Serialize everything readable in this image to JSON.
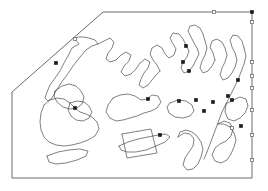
{
  "figure": {
    "kind": "vector-outline-map",
    "width": 268,
    "height": 191,
    "background_color": "#ffffff",
    "outline_color": "#4a4a4a",
    "frame_color": "#6b6b6b",
    "vertex_filled_color": "#1a1a1a",
    "vertex_open_fill": "#ffffff",
    "vertex_open_stroke": "#5a5a5a"
  },
  "frame": {
    "name": "study-area-boundary",
    "points": "103,12 252,12 252,178 12,178 12,92 103,12"
  },
  "regions": [
    {
      "name": "northwest-peninsula",
      "points": "75,39 79,44 72,48 68,56 64,63 60,71 55,78 50,85 47,92 45,98 48,101 52,98 56,91 61,83 67,75 73,66 80,57 86,50 92,46 98,44 95,40 89,38 83,37 78,37 75,39"
    },
    {
      "name": "north-central-inlet",
      "points": "98,44 104,41 110,38 114,42 112,48 108,53 106,59 110,62 116,60 121,55 126,52 131,55 129,61 124,66 121,72 125,76 131,74 136,69 140,63 145,59 150,62 148,68 144,73 141,79 139,85 143,88 148,85 152,80 156,75 160,71"
    },
    {
      "name": "central-highland",
      "points": "160,71 157,65 153,60 150,54 152,48 157,45 162,48 165,54 169,58 174,55 176,49 173,44 170,38 173,33 179,34 183,39 186,45 189,51 187,57 183,62 181,68 184,73 189,71 193,66 196,60 199,54 197,48 194,43 191,37 188,31 190,26 195,25 200,28 203,34 205,41 207,48 205,55 202,61 200,68 203,73 208,71 212,66 215,60"
    },
    {
      "name": "northeast-ridge",
      "points": "215,60 213,53 210,47 212,41 217,39 222,42 225,48 227,55 225,62 222,68 220,75 223,80 228,78 232,73 235,67 237,60 235,53 232,47 230,40 233,35 238,36 242,41 244,48"
    },
    {
      "name": "east-coast-arc",
      "points": "244,48 246,56 244,64 241,72 238,80 234,88 230,96 226,104 222,112 219,120 216,128 213,136 210,144 207,152 204,159"
    },
    {
      "name": "eastern-island-a",
      "points": "226,104 233,100 240,97 246,99 248,106 245,113 240,118 234,121 228,119 225,112 226,104"
    },
    {
      "name": "southeast-hook",
      "points": "218,124 224,121 230,123 233,129 231,136 226,141 220,144 215,148 212,155 215,161 221,163 227,160 231,154 234,147 236,140 234,133 230,127 224,124 218,124"
    },
    {
      "name": "central-lagoon",
      "points": "113,98 120,95 128,94 135,96 141,100 147,99 152,95 158,96 161,102 157,108 151,111 144,113 137,116 130,118 123,120 116,121 110,118 106,112 108,105 113,98"
    },
    {
      "name": "west-lake-major",
      "points": "44,105 50,100 57,98 64,99 70,103 75,108 80,112 86,114 92,117 97,122 99,129 95,136 88,140 80,143 72,145 64,146 56,145 49,142 44,137 41,130 40,122 41,113 44,105"
    },
    {
      "name": "west-lake-upper",
      "points": "55,91 62,86 69,84 76,86 81,91 84,97 82,104 77,108 70,109 63,107 57,102 54,96 55,91"
    },
    {
      "name": "west-lake-small",
      "points": "70,103 77,101 84,102 89,106 92,112 89,118 83,121 76,120 71,116 68,110 70,103"
    },
    {
      "name": "mid-ellipse-basin",
      "points": "170,103 178,100 186,101 192,105 194,111 190,116 183,118 175,117 169,113 167,107 170,103"
    },
    {
      "name": "south-wedge-strip",
      "points": "119,146 128,142 138,139 148,137 158,135 166,134 170,137 165,142 156,146 146,150 136,152 127,152 121,150 119,146"
    },
    {
      "name": "south-quadrangle",
      "points": "122,134 151,129 157,153 127,158 122,134"
    },
    {
      "name": "southwest-strip",
      "points": "47,156 58,152 69,150 80,149 88,151 86,156 77,160 66,163 56,164 49,162 47,156"
    },
    {
      "name": "southeast-valley",
      "points": "178,137 184,133 190,134 194,139 193,146 189,152 185,158 183,165 187,170 193,169 198,164 201,157 203,149 201,142 197,136 192,132 186,130 180,132 178,137"
    }
  ],
  "vertices": [
    {
      "name": "vertex-top-edge-open",
      "x": 214,
      "y": 12,
      "style": "open"
    },
    {
      "name": "vertex-top-right-corner",
      "x": 252,
      "y": 12,
      "style": "filled"
    },
    {
      "name": "vertex-right-edge-1",
      "x": 252,
      "y": 22,
      "style": "open"
    },
    {
      "name": "vertex-right-edge-2",
      "x": 252,
      "y": 62,
      "style": "open"
    },
    {
      "name": "vertex-right-edge-3",
      "x": 252,
      "y": 76,
      "style": "open"
    },
    {
      "name": "vertex-right-edge-4",
      "x": 252,
      "y": 88,
      "style": "open"
    },
    {
      "name": "vertex-right-edge-5",
      "x": 252,
      "y": 110,
      "style": "open"
    },
    {
      "name": "vertex-right-edge-6",
      "x": 252,
      "y": 135,
      "style": "open"
    },
    {
      "name": "vertex-northwest-apex",
      "x": 75,
      "y": 39,
      "style": "open"
    },
    {
      "name": "vertex-northwest-mid",
      "x": 56,
      "y": 63,
      "style": "filled"
    },
    {
      "name": "vertex-north-central",
      "x": 186,
      "y": 46,
      "style": "filled"
    },
    {
      "name": "vertex-north-central-lower",
      "x": 183,
      "y": 62,
      "style": "filled"
    },
    {
      "name": "vertex-central-junction",
      "x": 189,
      "y": 71,
      "style": "filled"
    },
    {
      "name": "vertex-central-lagoon-north",
      "x": 148,
      "y": 99,
      "style": "filled"
    },
    {
      "name": "vertex-east-node-a",
      "x": 238,
      "y": 80,
      "style": "filled"
    },
    {
      "name": "vertex-east-node-b",
      "x": 228,
      "y": 96,
      "style": "filled"
    },
    {
      "name": "vertex-east-node-c",
      "x": 213,
      "y": 102,
      "style": "filled"
    },
    {
      "name": "vertex-east-node-d",
      "x": 232,
      "y": 100,
      "style": "filled"
    },
    {
      "name": "vertex-mid-node-a",
      "x": 179,
      "y": 101,
      "style": "filled"
    },
    {
      "name": "vertex-mid-node-b",
      "x": 196,
      "y": 100,
      "style": "filled"
    },
    {
      "name": "vertex-mid-node-c",
      "x": 204,
      "y": 111,
      "style": "filled"
    },
    {
      "name": "vertex-west-lake-node",
      "x": 75,
      "y": 108,
      "style": "filled"
    },
    {
      "name": "vertex-south-strip-node",
      "x": 160,
      "y": 135,
      "style": "filled"
    },
    {
      "name": "vertex-southeast-node",
      "x": 232,
      "y": 128,
      "style": "open"
    },
    {
      "name": "vertex-southeast-node-b",
      "x": 241,
      "y": 126,
      "style": "filled"
    },
    {
      "name": "vertex-southeast-edge",
      "x": 252,
      "y": 160,
      "style": "open"
    }
  ]
}
